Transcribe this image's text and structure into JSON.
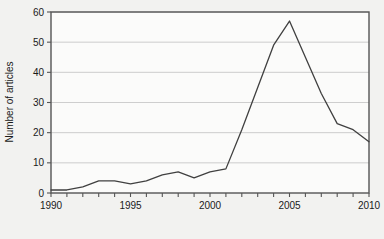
{
  "chart_data": {
    "type": "line",
    "title": "",
    "xlabel": "",
    "ylabel": "Number of articles",
    "x": [
      1990,
      1991,
      1992,
      1993,
      1994,
      1995,
      1996,
      1997,
      1998,
      1999,
      2000,
      2001,
      2002,
      2003,
      2004,
      2005,
      2006,
      2007,
      2008,
      2009,
      2010
    ],
    "values": [
      1,
      1,
      2,
      4,
      4,
      3,
      4,
      6,
      7,
      5,
      7,
      8,
      21,
      35,
      49,
      57,
      45,
      33,
      23,
      21,
      17
    ],
    "series": [
      {
        "name": "Number of articles",
        "values": [
          1,
          1,
          2,
          4,
          4,
          3,
          4,
          6,
          7,
          5,
          7,
          8,
          21,
          35,
          49,
          57,
          45,
          33,
          23,
          21,
          17
        ]
      }
    ],
    "xlim": [
      1990,
      2010
    ],
    "ylim": [
      0,
      60
    ],
    "ytick_values": [
      0,
      10,
      20,
      30,
      40,
      50,
      60
    ],
    "ytick_labels": [
      "0",
      "10",
      "20",
      "30",
      "40",
      "50",
      "60"
    ],
    "xtick_values": [
      1990,
      1991,
      1992,
      1993,
      1994,
      1995,
      1996,
      1997,
      1998,
      1999,
      2000,
      2001,
      2002,
      2003,
      2004,
      2005,
      2006,
      2007,
      2008,
      2009,
      2010
    ],
    "xtick_labeled": [
      1990,
      1995,
      2000,
      2005,
      2010
    ],
    "xtick_labels": [
      "1990",
      "1995",
      "2000",
      "2005",
      "2010"
    ],
    "grid": "horizontal",
    "legend": "none",
    "annotations": [],
    "colors": {
      "page_background": "#f2f2f0",
      "plot_background": "#fbfbfa",
      "plot_border": "#555555",
      "gridline": "#c8c8c8",
      "line": "#404040",
      "text": "#1a1a1a"
    }
  }
}
